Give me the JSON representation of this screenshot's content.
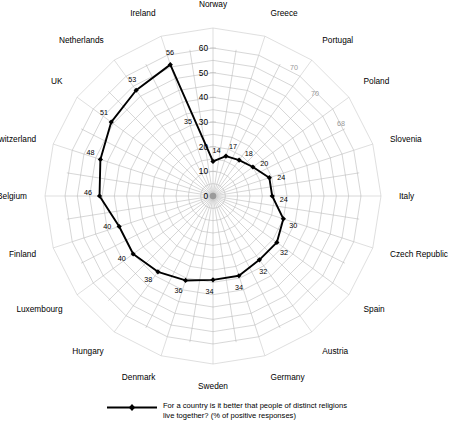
{
  "chart_data": {
    "type": "radar",
    "title": "",
    "subtitle": "",
    "xlabel": "",
    "ylabel": "",
    "rlim": [
      0,
      60
    ],
    "r_ticks": [
      "0",
      "10",
      "20",
      "30",
      "40",
      "50",
      "60"
    ],
    "r_tick_values": [
      0,
      10,
      20,
      30,
      40,
      50,
      60
    ],
    "grid": true,
    "legend_position": "bottom-center",
    "start_angle_deg": 90,
    "direction": "clockwise",
    "categories": [
      "Norway",
      "Greece",
      "Portugal",
      "Poland",
      "Slovenia",
      "Italy",
      "Czech Republic",
      "Spain",
      "Austria",
      "Germany",
      "Sweden",
      "Denmark",
      "Hungary",
      "Luxembourg",
      "Finland",
      "Belgium",
      "Switzerland",
      "UK",
      "Netherlands",
      "Ireland"
    ],
    "values": [
      14,
      17,
      18,
      20,
      24,
      24,
      30,
      32,
      32,
      34,
      34,
      36,
      38,
      40,
      40,
      46,
      48,
      51,
      53,
      56
    ],
    "series": [
      {
        "name": "For a country is it better that people of distinct religions live together? (% of positive responses)",
        "values": [
          14,
          17,
          18,
          20,
          24,
          24,
          30,
          32,
          32,
          34,
          34,
          36,
          38,
          40,
          40,
          46,
          48,
          51,
          53,
          56
        ],
        "color": "#000000",
        "marker": "diamond"
      }
    ],
    "annotations": [
      {
        "text": "35",
        "sector": "Norway-Ireland-segment",
        "color": "#000000"
      },
      {
        "text": "70",
        "sector": "Greece",
        "color": "#9a9a9a"
      },
      {
        "text": "70",
        "sector": "Portugal",
        "color": "#9a9a9a"
      },
      {
        "text": "68",
        "sector": "Poland",
        "color": "#9a9a9a"
      }
    ]
  },
  "legend": {
    "entries": [
      {
        "label_line_1": "For a country is it better that people of distinct religions",
        "label_line_2": "live together? (% of positive responses)",
        "color": "#000000"
      }
    ]
  }
}
